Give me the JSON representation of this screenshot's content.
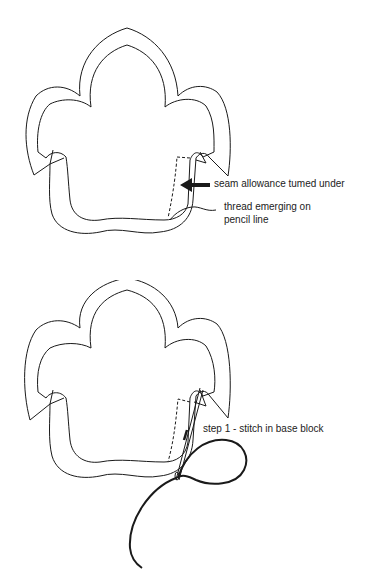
{
  "figures": [
    {
      "id": "top",
      "labels": {
        "seam": "seam allowance tumed under",
        "thread_line1": "thread emerging on",
        "thread_line2": "pencil line"
      }
    },
    {
      "id": "bottom",
      "labels": {
        "step": "step 1 - stitch in base block"
      }
    }
  ],
  "colors": {
    "stroke": "#1a1a1a",
    "background": "#ffffff"
  }
}
